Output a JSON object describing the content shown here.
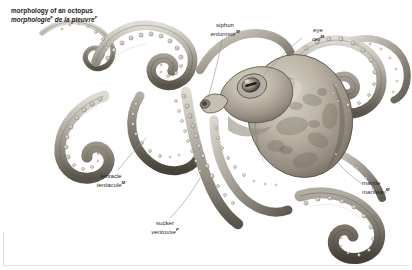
{
  "page": {
    "background_color": "#ffffff",
    "border_color": "#e2e2e2",
    "width": 412,
    "height": 270
  },
  "title": {
    "english": "morphology of an octopus",
    "french": "morphologie",
    "french_rest": " de la pieuvre",
    "french_gender_1": "F",
    "french_gender_2": "F"
  },
  "illustration": {
    "subject": "octopus",
    "style": "grayscale pencil anatomical engraving",
    "palette": {
      "mantle_light": "#cfc9bd",
      "mantle_mid": "#a49c8f",
      "mantle_dark": "#6e675d",
      "arm_light": "#d6d2ca",
      "arm_mid": "#9a958c",
      "arm_dark": "#5d584f",
      "sucker_fill": "#efece6",
      "sucker_stroke": "#6b655c",
      "outline": "#3c3831"
    }
  },
  "labels": [
    {
      "id": "siphon",
      "english": "siphon",
      "french": "entonnoir",
      "gender": "M"
    },
    {
      "id": "eye",
      "english": "eye",
      "french": "œil",
      "gender": "M"
    },
    {
      "id": "mantle",
      "english": "mantle",
      "french": "manteau",
      "gender": "M"
    },
    {
      "id": "tentacle",
      "english": "tentacle",
      "french": "tentacule",
      "gender": "M"
    },
    {
      "id": "sucker",
      "english": "sucker",
      "french": "ventouse",
      "gender": "F"
    }
  ],
  "leader_lines": {
    "color": "#8d8d8d",
    "width": 0.6
  }
}
